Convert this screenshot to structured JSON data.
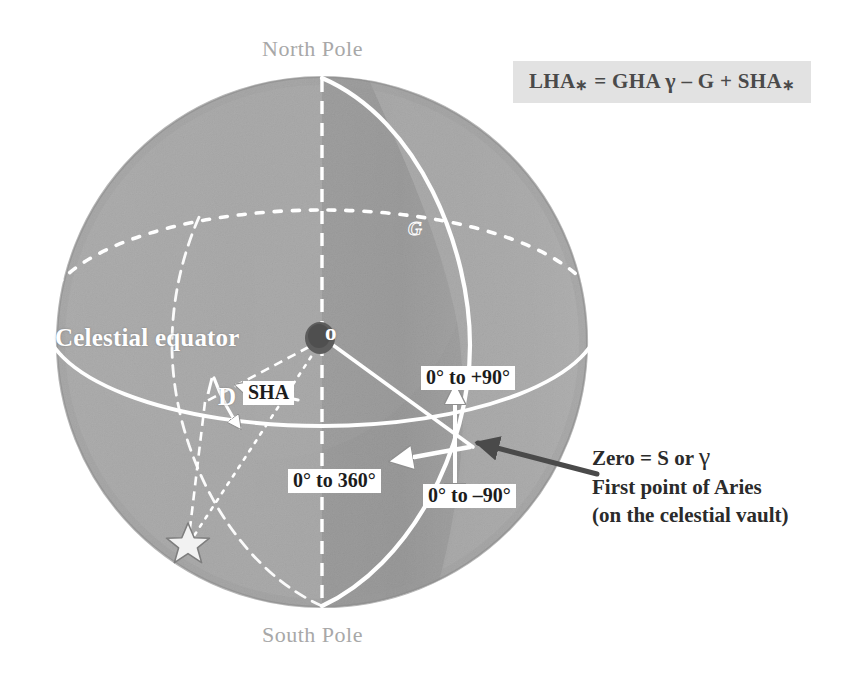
{
  "figure": {
    "type": "celestial-sphere-diagram",
    "background_color": "#ffffff"
  },
  "formula": {
    "box_background": "#e2e2e2",
    "text_color": "#4a4a4a",
    "full": "LHA* = GHA γ – G + SHA*",
    "parts": {
      "lha": "LHA",
      "star1": "∗",
      "equals": " = ",
      "gha": "GHA ",
      "gamma": "γ",
      "minus": " – ",
      "g": "G",
      "plus": " + ",
      "sha": "SHA",
      "star2": "∗"
    }
  },
  "poles": {
    "north": "North Pole",
    "south": "South Pole",
    "label_color": "#a8a8a8"
  },
  "sphere": {
    "center_x": 322,
    "center_y": 342,
    "radius": 265,
    "light_fill": "#a8a8a8",
    "dark_fill": "#8a8a8a",
    "edge_color": "#9a9a9a"
  },
  "labels": {
    "celestial_equator": "Celestial equator",
    "origin": "o",
    "greenwich_meridian": "G",
    "declination": "D",
    "sidereal_hour_angle": "SHA"
  },
  "ranges": {
    "declination_north": "0° to +90°",
    "declination_south": "0° to –90°",
    "hour_angle": "0° to 360°"
  },
  "annotation": {
    "line1_prefix": "Zero = S or ",
    "line1_symbol": "γ",
    "line2": "First point of Aries",
    "line3": "(on the celestial vault)",
    "arrow_color": "#4a4a4a",
    "text_color": "#2b2b2b"
  },
  "markers": {
    "star_symbol": "five-pointed-star",
    "star_color": "#ffffff"
  }
}
